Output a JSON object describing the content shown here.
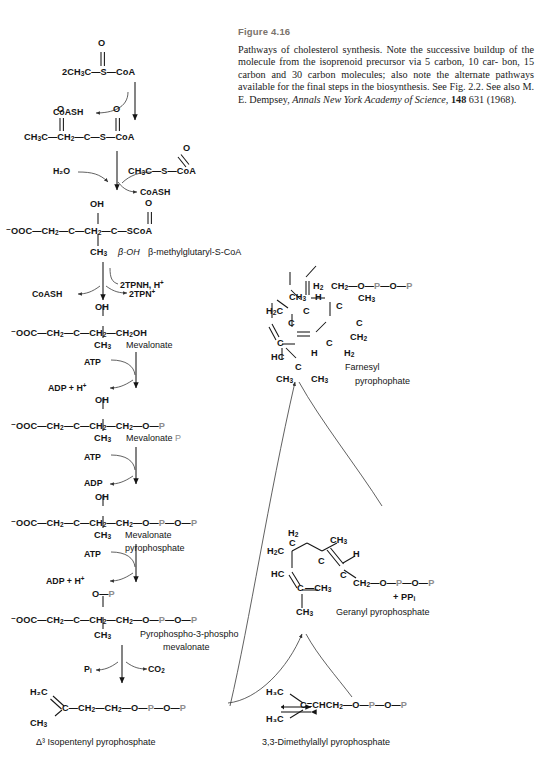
{
  "caption": {
    "figure_number": "Figure 4.16",
    "line1": "Pathways of cholesterol synthesis.  Note the successive buildup of",
    "line2": "the molecule from the isoprenoid precursor via 5 carbon, 10 car-",
    "line3": "bon, 15 carbon and 30 carbon molecules; also note the alternate",
    "line4": "pathways available for the final steps in the biosynthesis.  See",
    "line5_a": "Fig. 2.2. See also M. E. Dempsey, ",
    "line5_i": "Annals New York Academy of",
    "line6_i": "Science,",
    "line6_b": " 148",
    "line6_c": " 631 (1968)."
  },
  "colors": {
    "ink": "#151515",
    "phosphate_gray": "#8d8d8d",
    "caption_heading": "#7a736b",
    "background": "#ffffff"
  },
  "structures": {
    "acetyl_coa": {
      "formula": "2CH₃C—S—CoA",
      "carbonyl_o": "O",
      "parts": {
        "prefix": "2CH",
        "sub1": "3",
        "c": "C",
        "dash1": "—S—",
        "coa": "CoA"
      }
    },
    "acetoacetyl_coa": {
      "o_left": "O",
      "o_right": "O",
      "parts": {
        "a": "CH",
        "a_sub": "3",
        "b": "C—CH",
        "b_sub": "2",
        "c": "—C—S—",
        "coa": "CoA"
      }
    },
    "acetyl_coa_second": {
      "carbonyl_o": "O",
      "parts": {
        "prefix": "CH",
        "sub1": "3",
        "c": "C—S—",
        "coa": "CoA"
      }
    },
    "hmg_coa": {
      "oh": "OH",
      "carbonyl_o": "O",
      "backbone_a": "⁻OOC—CH",
      "backbone_a_sub": "2",
      "backbone_b": "—C—CH",
      "backbone_b_sub": "2",
      "backbone_c": "—C—SCoA",
      "methyl": "CH",
      "methyl_sub": "3",
      "name_a": "β-OH",
      "name_b": "β-methylglutaryl-S-CoA"
    },
    "mevalonate": {
      "oh": "OH",
      "backbone_a": "⁻OOC—CH",
      "backbone_a_sub": "2",
      "backbone_b": "—C—CH",
      "backbone_b_sub": "2",
      "backbone_c": "—CH",
      "backbone_c_sub": "2",
      "backbone_d": "OH",
      "methyl": "CH",
      "methyl_sub": "3",
      "name": "Mevalonate"
    },
    "mevalonate_p": {
      "oh": "OH",
      "backbone_a": "⁻OOC—CH",
      "backbone_a_sub": "2",
      "backbone_b": "—C—CH",
      "backbone_b_sub": "2",
      "backbone_c": "—CH",
      "backbone_c_sub": "2",
      "backbone_d": "—O—",
      "p": "P",
      "methyl": "CH",
      "methyl_sub": "3",
      "name": "Mevalonate",
      "name_p": "P"
    },
    "mevalonate_pp": {
      "oh": "OH",
      "backbone_a": "⁻OOC—CH",
      "backbone_a_sub": "2",
      "backbone_b": "—C—CH",
      "backbone_b_sub": "2",
      "backbone_c": "—CH",
      "backbone_c_sub": "2",
      "backbone_d": "—O—",
      "p1": "P",
      "mid": "—O—",
      "p2": "P",
      "methyl": "CH",
      "methyl_sub": "3",
      "name_line1": "Mevalonate",
      "name_line2": "pyrophosphate"
    },
    "pyrophospho_3_phospho_mevalonate": {
      "top_o": "O—",
      "top_p": "P",
      "backbone_a": "⁻OOC—CH",
      "backbone_a_sub": "2",
      "backbone_b": "—C—CH",
      "backbone_b_sub": "2",
      "backbone_c": "—CH",
      "backbone_c_sub": "2",
      "backbone_d": "—O—",
      "p1": "P",
      "mid": "—O—",
      "p2": "P",
      "methyl": "CH",
      "methyl_sub": "3",
      "name_line1": "Pyrophospho-3-phospho",
      "name_line2": "mevalonate"
    },
    "isopentenyl_pp": {
      "h2c": "H₂C",
      "c": "C—CH",
      "c_sub": "2",
      "chain": "—CH",
      "chain_sub": "2",
      "link": "—O—",
      "p1": "P",
      "mid": "—O—",
      "p2": "P",
      "methyl": "CH",
      "methyl_sub": "3",
      "name": "Δ³ Isopentenyl pyrophosphate"
    },
    "dimethylallyl_pp": {
      "h3c_top": "H₃C",
      "h3c_bottom": "H₃C",
      "core": "C=CHCH",
      "core_sub": "2",
      "link": "—O—",
      "p1": "P",
      "mid": "—O—",
      "p2": "P",
      "name": "3,3-Dimethylallyl pyrophosphate"
    },
    "geranyl_pp": {
      "h2_top": "H",
      "h2_top_sub": "2",
      "c_top": "C",
      "ch3_a": "CH",
      "ch3_a_sub": "3",
      "h2c": "H",
      "h2c_sub": "2",
      "h2c_c": "C",
      "c_mid": "C",
      "h": "H",
      "hc": "HC",
      "c_low": "C",
      "c_low_b": "C",
      "ch3_b": "—CH",
      "ch3_b_sub": "3",
      "ch2_chain": "CH",
      "ch2_chain_sub": "2",
      "link": "—O—",
      "p1": "P",
      "mid": "—O—",
      "p2": "P",
      "ch3_c": "CH",
      "ch3_c_sub": "3",
      "byproduct": "+ PP",
      "byproduct_sub": "i",
      "name": "Geranyl pyrophosphate"
    },
    "farnesyl_pp": {
      "ch2_top": "CH",
      "ch2_top_sub": "2",
      "link": "—O—",
      "p1": "P",
      "mid": "—O—",
      "p2": "P",
      "h_a": "H",
      "c_a": "C",
      "ch3_a": "CH",
      "ch3_a_sub": "3",
      "c_b": "C",
      "h2_b": "H",
      "h2_b_sub": "2",
      "c_c": "C",
      "ch3_b": "CH",
      "ch3_b_sub": "3",
      "h2c": "H",
      "h2c_sub": "2",
      "h2c_c": "C",
      "c_d": "C",
      "c_e": "C",
      "h_c": "H",
      "c_f": "C",
      "h2_c": "H",
      "h2_c_sub": "2",
      "hc": "HC",
      "c_g": "C",
      "ch3_c": "CH",
      "ch3_c_sub": "3",
      "ch3_d": "CH",
      "ch3_d_sub": "3",
      "name_line1": "Farnesyl",
      "name_line2": "pyrophophate"
    }
  },
  "cofactors": {
    "coash_1": "CoASH",
    "h2o": "H₂O",
    "coash_2": "CoASH",
    "tpnh": "2TPNH, H",
    "tpnh_sup": "+",
    "coash_3": "CoASH",
    "tpn": "2TPN",
    "tpn_sup": "+",
    "atp_1": "ATP",
    "adp_h_1": "ADP + H",
    "adp_h_1_sup": "+",
    "atp_2": "ATP",
    "adp_2": "ADP",
    "atp_3": "ATP",
    "adp_h_3": "ADP + H",
    "adp_h_3_sup": "+",
    "pi": "P",
    "pi_sub": "i",
    "co2": "CO",
    "co2_sub": "2"
  }
}
